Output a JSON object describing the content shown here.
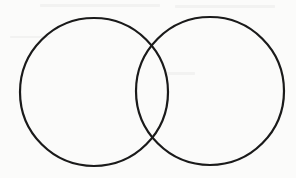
{
  "diagram": {
    "type": "venn",
    "width": 296,
    "height": 178,
    "background": "#fbfbfa",
    "stroke_color": "#1a1a1a",
    "stroke_width": 2.2,
    "sets": [
      {
        "name": "set-a",
        "cx": 94,
        "cy": 92,
        "r": 74,
        "label": ""
      },
      {
        "name": "set-b",
        "cx": 210,
        "cy": 91,
        "r": 74,
        "label": ""
      }
    ],
    "intersections": [
      {
        "x": 152,
        "y": 44
      },
      {
        "x": 152,
        "y": 141
      }
    ]
  }
}
